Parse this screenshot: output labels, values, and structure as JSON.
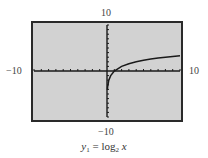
{
  "chart_data": {
    "type": "line",
    "title": "",
    "caption": {
      "y": "y",
      "sub1": "1",
      "eq": " = log",
      "sub2": "2",
      "x": " x"
    },
    "function": "y1 = log2 x",
    "xlabel": "",
    "ylabel": "",
    "xlim": [
      -10,
      10
    ],
    "ylim": [
      -10,
      10
    ],
    "xscl": 1,
    "yscl": 1,
    "grid": false,
    "window_labels": {
      "ymax": "10",
      "ymin": "−10",
      "xmin": "−10",
      "xmax": "10"
    },
    "series": [
      {
        "name": "y1 = log2 x",
        "x": [
          0.06,
          0.1,
          0.25,
          0.5,
          1,
          2,
          3,
          4,
          5,
          6,
          7,
          8,
          9,
          10
        ],
        "y": [
          -4.06,
          -3.32,
          -2,
          -1,
          0,
          1,
          1.58,
          2,
          2.32,
          2.58,
          2.81,
          3,
          3.17,
          3.32
        ]
      }
    ],
    "colors": {
      "screen_bg": "#d2d2d2",
      "frame": "#2a2a2a",
      "axis": "#1a1a1a",
      "curve": "#1a1a1a"
    }
  }
}
